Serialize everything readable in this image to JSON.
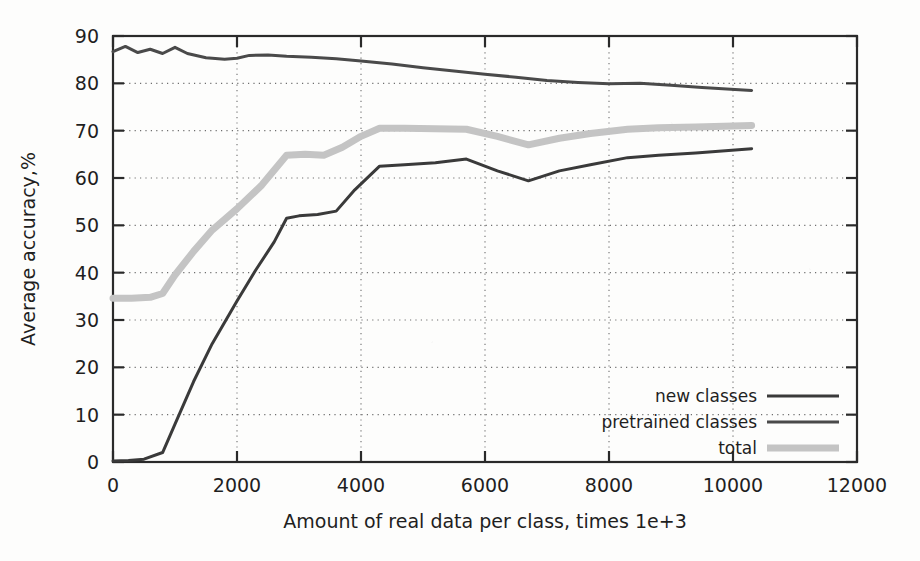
{
  "chart_data": {
    "type": "line",
    "title": "",
    "xlabel": "Amount of real data per class, times 1e+3",
    "ylabel": "Average accuracy,%",
    "xlim": [
      0,
      12000
    ],
    "ylim": [
      0,
      90
    ],
    "xticks": [
      0,
      2000,
      4000,
      6000,
      8000,
      10000,
      12000
    ],
    "xticklabels": [
      "0",
      "2000",
      "4000",
      "6000",
      "8000",
      "10000",
      "12000"
    ],
    "yticks": [
      0,
      10,
      20,
      30,
      40,
      50,
      60,
      70,
      80,
      90
    ],
    "yticklabels": [
      "0",
      "10",
      "20",
      "30",
      "40",
      "50",
      "60",
      "70",
      "80",
      "90"
    ],
    "grid": true,
    "grid_style": "dotted",
    "legend_position": "lower right",
    "series": [
      {
        "name": "new classes",
        "color": "#3a3a3a",
        "width": 3,
        "x": [
          0,
          250,
          500,
          800,
          1000,
          1300,
          1600,
          2000,
          2300,
          2600,
          2800,
          3000,
          3300,
          3600,
          3900,
          4300,
          4700,
          5200,
          5700,
          6200,
          6700,
          7200,
          7700,
          8300,
          8800,
          9400,
          10300
        ],
        "y": [
          0.2,
          0.3,
          0.6,
          2.0,
          8.0,
          17.0,
          25.0,
          34.0,
          40.5,
          46.5,
          51.5,
          52.0,
          52.3,
          53.0,
          57.5,
          62.5,
          62.8,
          63.2,
          64.0,
          61.5,
          59.4,
          61.5,
          62.8,
          64.3,
          64.8,
          65.3,
          66.2
        ]
      },
      {
        "name": "pretrained classes",
        "color": "#4a4a4a",
        "width": 3,
        "x": [
          0,
          200,
          400,
          600,
          800,
          1000,
          1200,
          1500,
          1800,
          2000,
          2200,
          2500,
          2800,
          3200,
          3600,
          4000,
          4500,
          5000,
          5500,
          6000,
          6500,
          7000,
          7500,
          8000,
          8500,
          9000,
          9500,
          10300
        ],
        "y": [
          86.7,
          87.8,
          86.5,
          87.2,
          86.3,
          87.6,
          86.3,
          85.4,
          85.1,
          85.3,
          85.9,
          86.0,
          85.7,
          85.5,
          85.2,
          84.7,
          84.1,
          83.3,
          82.6,
          81.9,
          81.3,
          80.6,
          80.2,
          79.9,
          80.0,
          79.6,
          79.1,
          78.5
        ]
      },
      {
        "name": "total",
        "color": "#c4c4c4",
        "width": 7,
        "x": [
          0,
          300,
          600,
          800,
          1000,
          1300,
          1600,
          2000,
          2400,
          2800,
          3100,
          3400,
          3700,
          4000,
          4300,
          4700,
          5200,
          5700,
          6200,
          6700,
          7200,
          7700,
          8300,
          8800,
          9400,
          10300
        ],
        "y": [
          34.6,
          34.6,
          34.8,
          35.6,
          39.5,
          44.5,
          49.0,
          53.5,
          58.5,
          64.8,
          65.0,
          64.8,
          66.5,
          68.8,
          70.5,
          70.5,
          70.4,
          70.3,
          68.8,
          67.0,
          68.4,
          69.4,
          70.3,
          70.6,
          70.8,
          71.1
        ]
      }
    ]
  },
  "legend": {
    "items": [
      {
        "label": "new classes",
        "color": "#3a3a3a",
        "width": 3
      },
      {
        "label": "pretrained classes",
        "color": "#4a4a4a",
        "width": 3
      },
      {
        "label": "total",
        "color": "#c4c4c4",
        "width": 7
      }
    ]
  }
}
